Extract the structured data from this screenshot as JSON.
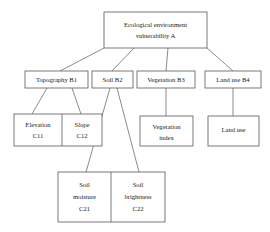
{
  "diagram": {
    "type": "hierarchy-tree",
    "levels": [
      "A",
      "B",
      "C"
    ],
    "style": {
      "box_fill": "#ffffff",
      "box_border": "#595959",
      "connector_color": "#595959",
      "text_color": "#1a1a1a",
      "background": "#ffffff"
    },
    "root": {
      "id": "A",
      "line1": "Ecological environment",
      "line2": "vulnerability A"
    },
    "criteria": [
      {
        "id": "B1",
        "label": "Topography B1"
      },
      {
        "id": "B2",
        "label": "Soil B2"
      },
      {
        "id": "B3",
        "label": "Vegetation B3"
      },
      {
        "id": "B4",
        "label": "Land use B4"
      }
    ],
    "indicators": {
      "c11": {
        "id": "C11",
        "line1": "Elevation",
        "line2": "C11"
      },
      "c12": {
        "id": "C12",
        "line1": "Slope",
        "line2": "C12"
      },
      "c21": {
        "id": "C21",
        "line1": "Soil",
        "line2": "moisture",
        "line3": "C21"
      },
      "c22": {
        "id": "C22",
        "line1": "Soil",
        "line2": "brightness",
        "line3": "C22"
      },
      "veg": {
        "id": "VEG",
        "line1": "Vegetation",
        "line2": "index"
      },
      "land": {
        "id": "LAND",
        "line1": "Land use",
        "line2": ""
      }
    },
    "edges": [
      {
        "from": "A",
        "to": "B1"
      },
      {
        "from": "A",
        "to": "B2"
      },
      {
        "from": "A",
        "to": "B3"
      },
      {
        "from": "A",
        "to": "B4"
      },
      {
        "from": "B1",
        "to": "C11"
      },
      {
        "from": "B1",
        "to": "C12"
      },
      {
        "from": "B2",
        "to": "C21"
      },
      {
        "from": "B2",
        "to": "C22"
      },
      {
        "from": "B3",
        "to": "VEG"
      },
      {
        "from": "B4",
        "to": "LAND"
      }
    ]
  }
}
